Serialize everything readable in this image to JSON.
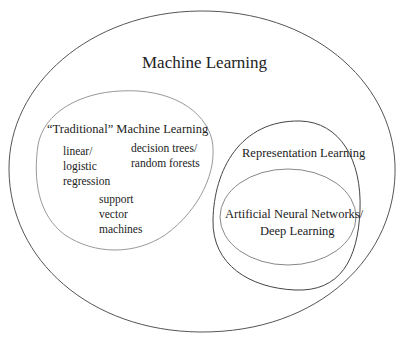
{
  "diagram": {
    "type": "nested-venn",
    "colors": {
      "outer_stroke": "#555555",
      "traditional_stroke": "#999999",
      "representation_stroke": "#444444",
      "ann_stroke": "#888888",
      "text": "#222222"
    },
    "machine_learning": {
      "label": "Machine Learning"
    },
    "traditional": {
      "label": "“Traditional” Machine Learning",
      "items": [
        "linear/\nlogistic\nregression",
        "decision trees/\nrandom forests",
        "support\nvector\nmachines"
      ]
    },
    "representation": {
      "label": "Representation Learning"
    },
    "ann": {
      "label_line1": "Artificial Neural Networks/",
      "label_line2": "Deep Learning"
    }
  }
}
